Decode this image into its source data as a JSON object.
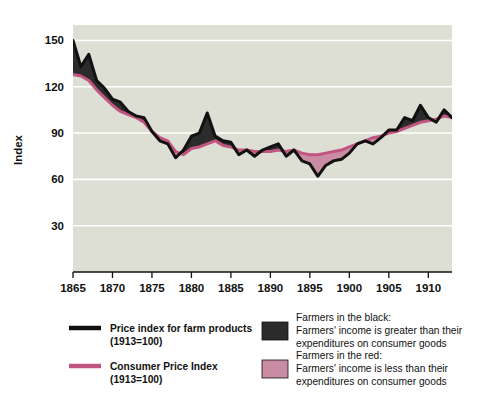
{
  "chart_data": {
    "type": "area",
    "title": "",
    "xlabel": "",
    "ylabel": "Index",
    "xlim": [
      1865,
      1913
    ],
    "ylim": [
      0,
      160
    ],
    "grid": true,
    "gridlines_y": [
      30,
      60,
      90,
      120,
      150
    ],
    "xticks": [
      1865,
      1870,
      1875,
      1880,
      1885,
      1890,
      1895,
      1900,
      1905,
      1910
    ],
    "yticks": [
      30,
      60,
      90,
      120,
      150
    ],
    "legend_position": "below-plot",
    "x": [
      1865,
      1866,
      1867,
      1868,
      1869,
      1870,
      1871,
      1872,
      1873,
      1874,
      1875,
      1876,
      1877,
      1878,
      1879,
      1880,
      1881,
      1882,
      1883,
      1884,
      1885,
      1886,
      1887,
      1888,
      1889,
      1890,
      1891,
      1892,
      1893,
      1894,
      1895,
      1896,
      1897,
      1898,
      1899,
      1900,
      1901,
      1902,
      1903,
      1904,
      1905,
      1906,
      1907,
      1908,
      1909,
      1910,
      1911,
      1912,
      1913
    ],
    "series": [
      {
        "name": "Price index for farm products (1913=100)",
        "color": "#111111",
        "values": [
          150,
          133,
          141,
          124,
          119,
          112,
          110,
          104,
          101,
          100,
          91,
          85,
          83,
          74,
          79,
          88,
          90,
          103,
          88,
          85,
          84,
          76,
          79,
          75,
          79,
          81,
          83,
          75,
          79,
          72,
          70,
          62,
          69,
          72,
          73,
          77,
          83,
          85,
          83,
          87,
          92,
          92,
          100,
          98,
          108,
          100,
          97,
          105,
          100
        ]
      },
      {
        "name": "Consumer Price Index (1913=100)",
        "color": "#c0567f",
        "values": [
          128,
          127,
          124,
          118,
          113,
          108,
          104,
          102,
          100,
          97,
          91,
          87,
          85,
          78,
          76,
          80,
          81,
          83,
          85,
          82,
          81,
          79,
          79,
          78,
          78,
          78,
          79,
          78,
          79,
          77,
          76,
          76,
          77,
          78,
          79,
          81,
          83,
          85,
          87,
          88,
          90,
          91,
          93,
          95,
          97,
          98,
          99,
          101,
          100
        ]
      }
    ],
    "fills": [
      {
        "name": "Farmers in the black",
        "color": "#2b2b2b",
        "meaning": "Farm product price index above consumer price index"
      },
      {
        "name": "Farmers in the red",
        "color": "#c98ca3",
        "meaning": "Farm product price index below consumer price index"
      }
    ],
    "plot_background": "#dedfd4"
  },
  "axes": {
    "y_title": "Index"
  },
  "legend": {
    "line_entries": [
      {
        "swatch": "black-line-swatch",
        "line1": "Price index for farm products",
        "line2": "(1913=100)"
      },
      {
        "swatch": "pink-line-swatch",
        "line1": "Consumer Price Index",
        "line2": "(1913=100)"
      }
    ],
    "fill_entries": [
      {
        "swatch": "black-fill-swatch",
        "line1": "Farmers in the black:",
        "line2": "Farmers' income is greater than their",
        "line3": "expenditures on consumer goods"
      },
      {
        "swatch": "pink-fill-swatch",
        "line1": "Farmers in the red:",
        "line2": "Farmers' income is less than their",
        "line3": "expenditures on consumer goods"
      }
    ]
  },
  "colors": {
    "black_line": "#111111",
    "pink_line": "#c0567f",
    "black_fill": "#2b2b2b",
    "pink_fill": "#c98ca3",
    "plot_bg": "#dedfd4",
    "page_bg": "#ffffff",
    "gridline": "#ffffff"
  }
}
